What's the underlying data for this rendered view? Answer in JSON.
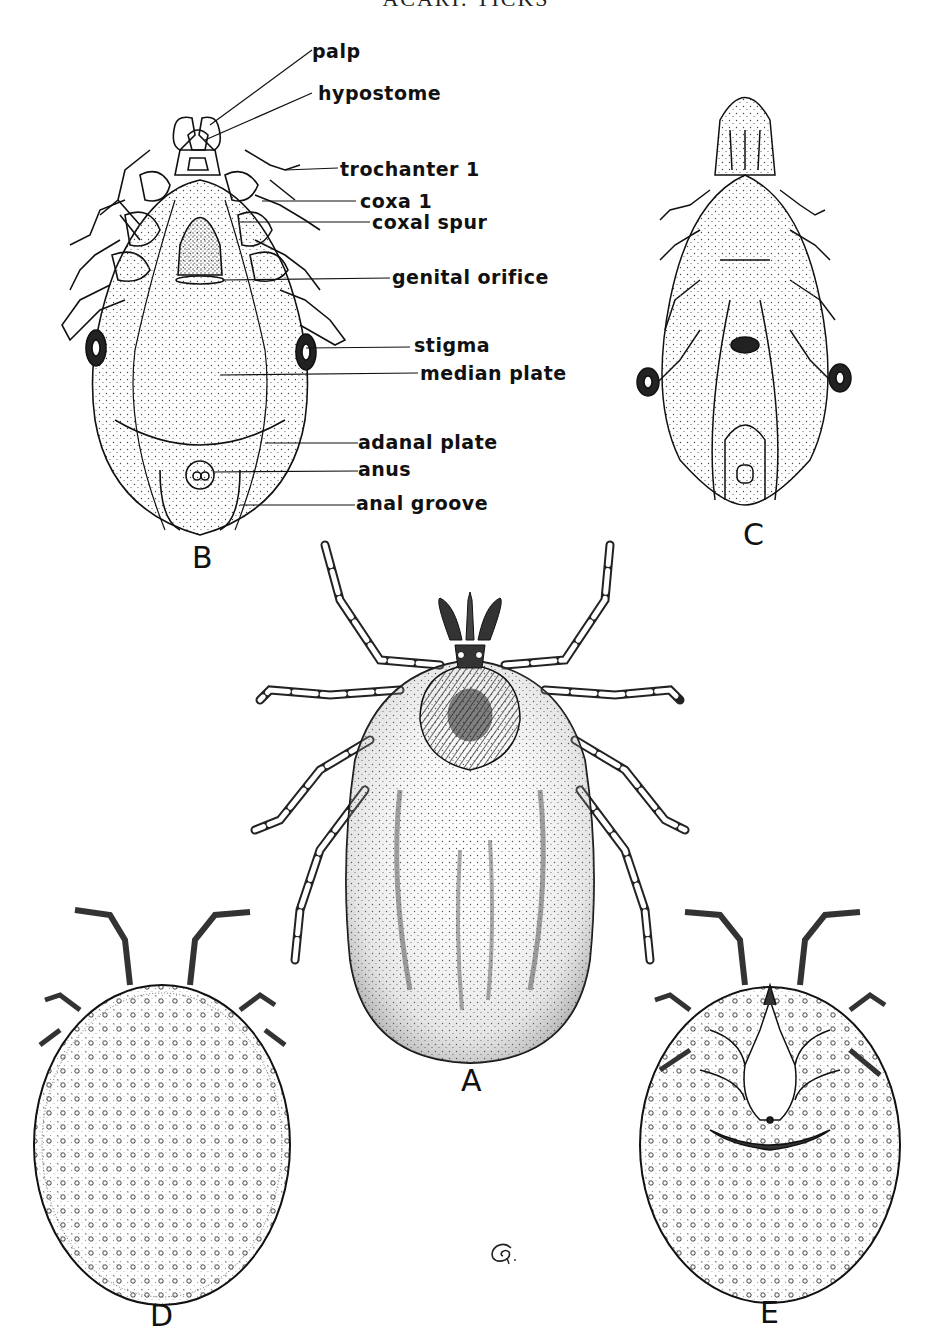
{
  "plate": {
    "title": "ACARI: TICKS"
  },
  "figure_b": {
    "letter": "B",
    "labels": [
      {
        "id": "palp",
        "text": "palp"
      },
      {
        "id": "hypostome",
        "text": "hypostome"
      },
      {
        "id": "trochanter-1",
        "text": "trochanter 1"
      },
      {
        "id": "coxa-1",
        "text": "coxa 1"
      },
      {
        "id": "coxal-spur",
        "text": "coxal spur"
      },
      {
        "id": "genital-orifice",
        "text": "genital orifice"
      },
      {
        "id": "stigma",
        "text": "stigma"
      },
      {
        "id": "median-plate",
        "text": "median plate"
      },
      {
        "id": "adanal-plate",
        "text": "adanal plate"
      },
      {
        "id": "anus",
        "text": "anus"
      },
      {
        "id": "anal-groove",
        "text": "anal groove"
      }
    ]
  },
  "figure_c": {
    "letter": "C"
  },
  "figure_a": {
    "letter": "A"
  },
  "figure_d": {
    "letter": "D"
  },
  "figure_e": {
    "letter": "E"
  },
  "signature": {
    "icon": "artist-monogram-icon"
  },
  "colors": {
    "ink": "#111111",
    "paper": "#ffffff",
    "stipple": "#555555"
  }
}
